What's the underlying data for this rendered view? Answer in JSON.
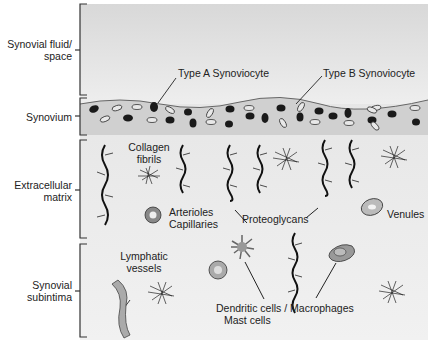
{
  "layers": [
    {
      "id": "fluid",
      "label_line1": "Synovial fluid/",
      "label_line2": "space"
    },
    {
      "id": "synovium",
      "label_line1": "Synovium"
    },
    {
      "id": "ecm",
      "label_line1": "Extracellular",
      "label_line2": "matrix"
    },
    {
      "id": "subintima",
      "label_line1": "Synovial",
      "label_line2": "subintima"
    }
  ],
  "annotations": {
    "type_a": "Type A Synoviocyte",
    "type_b": "Type B Synoviocyte",
    "collagen_1": "Collagen",
    "collagen_2": "fibrils",
    "arterioles": "Arterioles",
    "capillaries": "Capillaries",
    "proteoglycans": "Proteoglycans",
    "venules": "Venules",
    "lymphatic_1": "Lymphatic",
    "lymphatic_2": "vessels",
    "dendritic": "Dendritic cells / Macrophages",
    "mast": "Mast cells"
  },
  "colors": {
    "background_gray": "#e6e6e6",
    "synovium_fill": "#d2d2d2",
    "cell_dark": "#1a1a1a",
    "cell_gray": "#9a9a9a"
  }
}
